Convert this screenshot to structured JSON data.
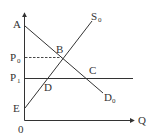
{
  "diagram": {
    "type": "supply-demand",
    "axes": {
      "y_label": "",
      "x_label": "Q",
      "origin_label": "0"
    },
    "curves": {
      "supply": {
        "label": "S",
        "subscript": "0"
      },
      "demand": {
        "label": "D",
        "subscript": "0"
      }
    },
    "price_levels": [
      {
        "label": "P",
        "subscript": "0",
        "style": "dashed"
      },
      {
        "label": "P",
        "subscript": "1",
        "style": "solid"
      }
    ],
    "points": {
      "A": "A",
      "B": "B",
      "C": "C",
      "D": "D",
      "E": "E"
    },
    "colors": {
      "line": "#333333",
      "background": "#ffffff"
    }
  }
}
